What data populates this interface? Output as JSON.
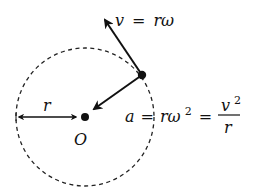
{
  "diagram": {
    "colors": {
      "ink": "#111111",
      "background": "#ffffff"
    },
    "circle": {
      "style": "dashed",
      "center_label": "O"
    },
    "radius_label": "r",
    "velocity_label": {
      "lhs": "v",
      "eq": "=",
      "rhs": "rω"
    },
    "acceleration_label": {
      "lhs": "a",
      "eq1": "=",
      "mid": "rω",
      "mid_exp": "2",
      "eq2": "=",
      "frac_num": "v",
      "frac_num_exp": "2",
      "frac_den": "r"
    },
    "elements": [
      "dashed-circle",
      "center-point-O",
      "particle-point",
      "velocity-arrow",
      "acceleration-arrow",
      "radius-arrow"
    ]
  }
}
